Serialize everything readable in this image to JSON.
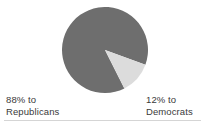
{
  "chart_data": {
    "type": "pie",
    "title": "",
    "subtitle": "",
    "xlabel": "",
    "ylabel": "",
    "legend_position": "below-chart",
    "grid": false,
    "categories": [
      "Republicans",
      "Democrats"
    ],
    "values": [
      88,
      12
    ],
    "units": "percent",
    "slices": [
      {
        "label": "Republicans",
        "value": 88,
        "value_text": "88%",
        "color": "#6e6e6e",
        "start_angle_deg": 63,
        "end_angle_deg": 380
      },
      {
        "label": "Democrats",
        "value": 12,
        "value_text": "12%",
        "color": "#dcdcdc",
        "start_angle_deg": 20,
        "end_angle_deg": 63
      }
    ],
    "annotations": [
      {
        "line1": "88% to",
        "line2": "Republicans"
      },
      {
        "line1": "12% to",
        "line2": "Democrats"
      }
    ]
  },
  "labels": {
    "republicans": {
      "line1": "88% to",
      "line2": "Republicans"
    },
    "democrats": {
      "line1": "12% to",
      "line2": "Democrats"
    }
  },
  "colors": {
    "background": "#ffffff",
    "republicans_slice": "#6e6e6e",
    "democrats_slice": "#dcdcdc",
    "slice_edge": "#9a9a9a",
    "text": "#3a3a3a",
    "rule": "#d5d5d5"
  }
}
